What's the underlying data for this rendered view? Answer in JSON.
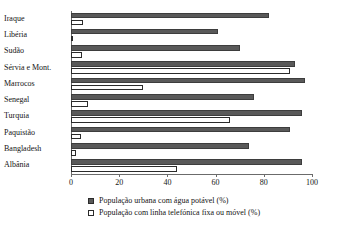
{
  "chart_data": {
    "type": "bar",
    "orientation": "horizontal",
    "title": "",
    "subtitle": "",
    "xlabel": "",
    "ylabel": "",
    "xlim": [
      0,
      100
    ],
    "xticks": [
      "0",
      "20",
      "40",
      "60",
      "80",
      "100"
    ],
    "grid": false,
    "legend_position": "bottom",
    "categories": [
      "Iraque",
      "Libéria",
      "Sudão",
      "Sérvia e Mont.",
      "Marrocos",
      "Senegal",
      "Turquia",
      "Paquistão",
      "Bangladesh",
      "Albânia"
    ],
    "series": [
      {
        "name": "População urbana com água potável (%)",
        "key": "water",
        "color": "#595959",
        "values": [
          82,
          61,
          70,
          93,
          97,
          76,
          96,
          91,
          74,
          96
        ]
      },
      {
        "name": "População com linha telefónica fixa ou móvel (%)",
        "key": "phone",
        "color": "#ffffff",
        "values": [
          5,
          1,
          4.5,
          91,
          30,
          7,
          66,
          4,
          2,
          44
        ]
      }
    ]
  },
  "legend": {
    "items": [
      {
        "label": "População urbana com água potável (%)",
        "swatch": "filled-square-icon"
      },
      {
        "label": "População com linha telefónica fixa ou móvel (%)",
        "swatch": "outline-square-icon"
      }
    ]
  }
}
